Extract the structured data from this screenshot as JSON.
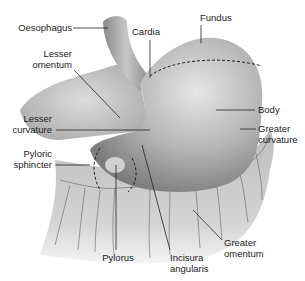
{
  "diagram": {
    "labels": {
      "oesophagus": "Oesophagus",
      "cardia": "Cardia",
      "fundus": "Fundus",
      "lesser_omentum_1": "Lesser",
      "lesser_omentum_2": "omentum",
      "lesser_curvature_1": "Lesser",
      "lesser_curvature_2": "curvature",
      "body": "Body",
      "greater_curvature_1": "Greater",
      "greater_curvature_2": "curvature",
      "pyloric_sphincter_1": "Pyloric",
      "pyloric_sphincter_2": "sphincter",
      "pylorus": "Pylorus",
      "incisura_1": "Incisura",
      "incisura_2": "angularis",
      "greater_omentum_1": "Greater",
      "greater_omentum_2": "omentum"
    },
    "colors": {
      "stomach_light": "#d8d8d8",
      "stomach_mid": "#a8a8a8",
      "stomach_dark": "#7a7a7a",
      "leader_line": "#222222"
    }
  }
}
